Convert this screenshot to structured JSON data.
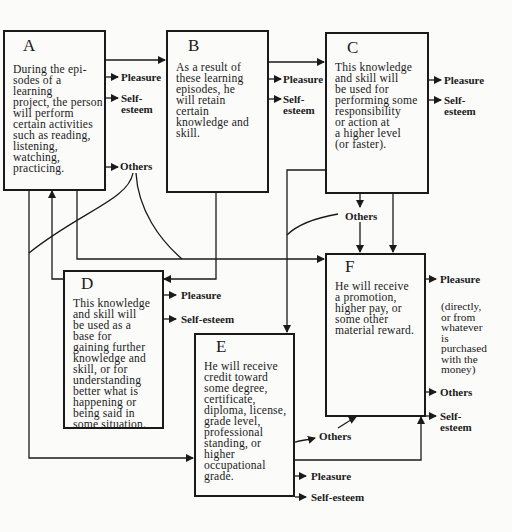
{
  "boxes": {
    "A": {
      "letter": "A",
      "text": "During the epi-\nsodes of a learning\nproject, the person\nwill perform\ncertain activities\nsuch as reading,\nlistening,\nwatching,\npracticing."
    },
    "B": {
      "letter": "B",
      "text": "As a result of\nthese learning\nepisodes, he\nwill retain\ncertain\nknowledge and\nskill."
    },
    "C": {
      "letter": "C",
      "text": "This knowledge\nand skill will\nbe used for\nperforming some\nresponsibility\nor action at\na higher level\n(or faster)."
    },
    "D": {
      "letter": "D",
      "text": "This knowledge\nand skill will\nbe used as a\nbase for\ngaining further\nknowledge and\nskill, or for\nunderstanding\nbetter what is\nhappening or\nbeing said in\nsome situation."
    },
    "E": {
      "letter": "E",
      "text": "He will receive\ncredit toward\nsome degree,\ncertificate,\ndiploma, license,\ngrade level,\nprofessional\nstanding, or\nhigher\noccupational\ngrade."
    },
    "F": {
      "letter": "F",
      "text": "He will receive\na promotion,\nhigher pay, or\nsome other\nmaterial reward."
    }
  },
  "outcomes": {
    "A": {
      "pleasure": "Pleasure",
      "self_esteem": "Self-\nesteem",
      "others": "Others"
    },
    "B": {
      "pleasure": "Pleasure",
      "self_esteem": "Self-\nesteem"
    },
    "C": {
      "pleasure": "Pleasure",
      "self_esteem": "Self-\nesteem",
      "others": "Others"
    },
    "D": {
      "pleasure": "Pleasure",
      "self_esteem": "Self-esteem"
    },
    "E": {
      "others": "Others",
      "pleasure": "Pleasure",
      "self_esteem": "Self-esteem"
    },
    "F": {
      "pleasure": "Pleasure",
      "note": "(directly,\nor from\nwhatever\nis\npurchased\nwith the\nmoney)",
      "others": "Others",
      "self_esteem": "Self-\nesteem"
    }
  },
  "colors": {
    "ink": "#1a1a1a",
    "paper": "#fbfbfa"
  }
}
